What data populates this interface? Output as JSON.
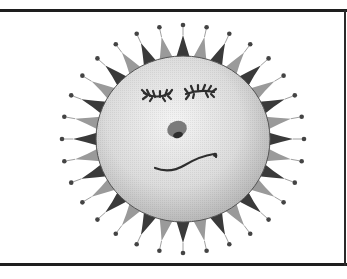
{
  "illustration": {
    "subject": "smiling sun with closed eyes",
    "center": [
      183,
      139
    ],
    "face_radius": [
      87,
      83
    ],
    "ray_count": 32,
    "ray_outer_radius": [
      110,
      104
    ],
    "dot_radius": [
      121,
      114
    ],
    "colors": {
      "ray_dark": "#3a3a3a",
      "ray_light": "#9a9a9a",
      "face_highlight": "#f4f4f4",
      "face_shadow": "#b8b8b8",
      "outline": "#555555",
      "features": "#2e2e2e",
      "nose": "#7a7a7a",
      "dot": "#444444",
      "frame": "#1e1e1e"
    }
  },
  "frame": {
    "top_y": 10,
    "bottom_y": 264
  }
}
